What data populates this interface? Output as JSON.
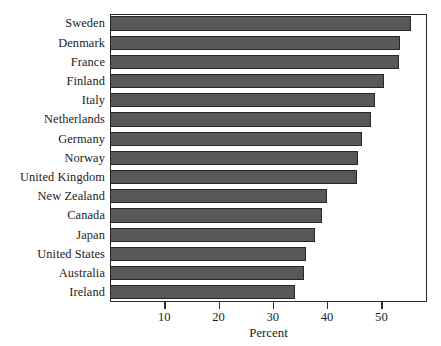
{
  "chart_data": {
    "type": "bar",
    "orientation": "horizontal",
    "title": "",
    "xlabel": "Percent",
    "ylabel": "",
    "categories": [
      "Sweden",
      "Denmark",
      "France",
      "Finland",
      "Italy",
      "Netherlands",
      "Germany",
      "Norway",
      "United Kingdom",
      "New Zealand",
      "Canada",
      "Japan",
      "United States",
      "Australia",
      "Ireland"
    ],
    "values": [
      55.4,
      53.5,
      53.2,
      50.5,
      48.8,
      48.1,
      46.4,
      45.7,
      45.5,
      40.0,
      39.0,
      37.8,
      36.1,
      35.7,
      34.1
    ],
    "xlim": [
      0,
      58.4
    ],
    "xticks": [
      10,
      20,
      30,
      40,
      50
    ],
    "xtick_labels": [
      "10",
      "20",
      "30",
      "40",
      "50"
    ],
    "grid": false,
    "legend": null,
    "bar_color": "#585858",
    "bar_edge_color": "#272727",
    "frame_color": "#2b2b2b"
  }
}
